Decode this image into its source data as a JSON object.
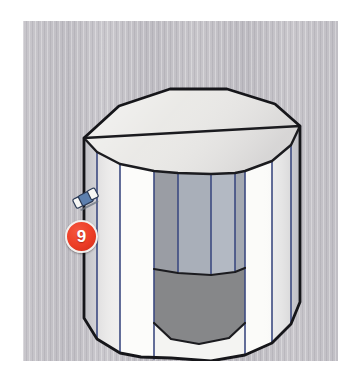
{
  "figure": {
    "shape_name": "decagonal-prism",
    "panel": {
      "background_color": "#c3c1c6",
      "left": 23,
      "top": 21,
      "width": 315,
      "height": 340
    }
  },
  "annotations": {
    "step_badge": {
      "label": "9",
      "fill_color": "#ec3d25",
      "text_color": "#ffffff",
      "ring_color": "#f2f0ee"
    },
    "tool_icon": {
      "name": "eraser-icon",
      "body_color": "#5c7fae",
      "tip_color": "#f4f4f2",
      "outline_color": "#2b3a55",
      "shadow_color": "#6b7480"
    }
  },
  "geometry": {
    "outline_color": "#1b1b1f",
    "facet_edge_color": "#3c4a80",
    "outer_facets": [
      {
        "name": "outer-facet-left-far",
        "points": "61,117 61,297 74,318 74,131",
        "fill": "#e2e2e4"
      },
      {
        "name": "outer-facet-left-mid",
        "points": "74,131 74,318 97,332 97,143",
        "fill": "#f2f2f1"
      },
      {
        "name": "outer-facet-left-near",
        "points": "97,143 97,332 131,338 131,150",
        "fill": "#fbfbfa"
      },
      {
        "name": "outer-facet-right-near",
        "points": "222,150 222,334 249,322 249,140",
        "fill": "#fafaf8"
      },
      {
        "name": "outer-facet-right-mid",
        "points": "249,140 249,322 268,303 268,124",
        "fill": "#efefee"
      },
      {
        "name": "outer-facet-right-far",
        "points": "268,124 268,303 277,281 277,105",
        "fill": "#d9d9dd"
      }
    ],
    "inner_facets": [
      {
        "name": "inner-facet-1",
        "points": "131,150 131,247 155,251 155,152",
        "fill": "#9b9ea5"
      },
      {
        "name": "inner-facet-2",
        "points": "155,152 155,251 188,253 188,153",
        "fill": "#aab0ba"
      },
      {
        "name": "inner-facet-3",
        "points": "188,153 188,253 212,250 212,152",
        "fill": "#b4bac4"
      },
      {
        "name": "inner-facet-4",
        "points": "212,152 212,250 222,246 222,150",
        "fill": "#a6abb4"
      }
    ],
    "inner_floor": {
      "name": "inner-floor",
      "points": "131,247 155,251 188,253 212,250 222,246 222,301 206,316 176,322 148,317 131,301",
      "fill": "#848589"
    },
    "top_rim_face": {
      "name": "top-rim-face",
      "points": "61,117 96,85 147,68 204,68 252,83 277,105 268,124 249,140 222,150 188,153 155,152 131,150 97,143 74,131",
      "fill": "#e7e6e3"
    },
    "outer_silhouette": {
      "name": "prism-outer-silhouette",
      "points": "61,117 96,85 147,68 204,68 252,83 277,105 277,281 268,303 249,322 222,334 188,340 148,337 118,336 97,332 74,318 61,297"
    },
    "inner_rim": {
      "name": "inner-rim-opening",
      "points": "131,150 155,152 188,153 212,152 222,150 249,140 268,124 277,105 252,83 204,68 147,68 96,85 61,117 74,131 97,143"
    }
  }
}
